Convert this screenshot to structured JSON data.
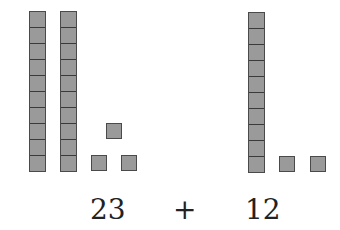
{
  "diagram": {
    "type": "base-ten-blocks-addition",
    "left_addend": {
      "value": "23",
      "tens_rods": 2,
      "ones_cubes": 3
    },
    "operator": "+",
    "right_addend": {
      "value": "12",
      "tens_rods": 1,
      "ones_cubes": 2
    },
    "colors": {
      "block_fill": "#9a9a9a",
      "block_border": "#4a4a4a",
      "text": "#222222"
    }
  }
}
